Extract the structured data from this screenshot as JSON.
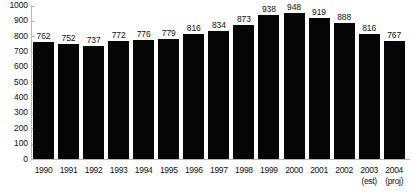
{
  "chart_data": {
    "type": "bar",
    "title": "",
    "subtitle": "",
    "xlabel": "",
    "ylabel": "",
    "categories": [
      "1990",
      "1991",
      "1992",
      "1993",
      "1994",
      "1995",
      "1996",
      "1997",
      "1998",
      "1999",
      "2000",
      "2001",
      "2002",
      "2003",
      "2004"
    ],
    "category_notes": [
      "",
      "",
      "",
      "",
      "",
      "",
      "",
      "",
      "",
      "",
      "",
      "",
      "",
      "(est)",
      "(proj)"
    ],
    "values": [
      762,
      752,
      737,
      772,
      776,
      779,
      816,
      834,
      873,
      938,
      948,
      919,
      888,
      816,
      767
    ],
    "data_labels": [
      "762",
      "752",
      "737",
      "772",
      "776",
      "779",
      "816",
      "834",
      "873",
      "938",
      "948",
      "919",
      "888",
      "816",
      "767"
    ],
    "ylim": [
      0,
      1000
    ],
    "ytick_labels": [
      "1000",
      "900",
      "800",
      "700",
      "600",
      "500",
      "400",
      "300",
      "200",
      "100",
      "0"
    ],
    "ytick_values": [
      1000,
      900,
      800,
      700,
      600,
      500,
      400,
      300,
      200,
      100,
      0
    ],
    "grid": false,
    "legend": false,
    "legend_position": "none",
    "bar_color": "#050505",
    "axis_color": "#b8b8b8",
    "text_color": "#111111",
    "background_color": "#ffffff"
  }
}
